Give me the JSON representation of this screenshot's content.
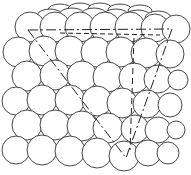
{
  "figure": {
    "stroke_color": "#333333",
    "background": "#ffffff"
  },
  "guide_lines": {
    "top_left": [
      28,
      30
    ],
    "top_right": [
      172,
      29
    ],
    "bottom_vertex": [
      126,
      158
    ],
    "vertical_top": [
      134,
      38
    ]
  }
}
